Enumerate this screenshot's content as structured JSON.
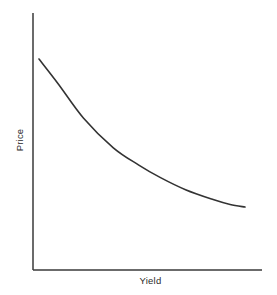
{
  "chart_data": {
    "type": "line",
    "title": "",
    "subtitle": "",
    "xlabel": "Yield",
    "ylabel": "Price",
    "grid": false,
    "legend": null,
    "legend_position": "none",
    "annotations": [],
    "xtick_labels": [],
    "ytick_labels": [],
    "xlim": [
      0,
      1
    ],
    "ylim": [
      0,
      1
    ],
    "series": [
      {
        "name": "price-yield-curve",
        "color": "#333333",
        "x": [
          0.03,
          0.12,
          0.24,
          0.38,
          0.5,
          0.6,
          0.72,
          0.85,
          0.93,
          1.0
        ],
        "y": [
          0.82,
          0.72,
          0.58,
          0.46,
          0.39,
          0.34,
          0.29,
          0.25,
          0.23,
          0.22
        ]
      }
    ]
  },
  "axes": {
    "line_color": "#3a3a3a",
    "y_axis_top": 13,
    "origin_x": 33,
    "origin_y": 270,
    "x_axis_right": 262
  },
  "curve_path": "M 39 59 C 57 83, 72 108, 88 133 C 104 150, 112 154, 120 159 C 140 170, 155 176, 170 180 C 192 189, 214 197, 228 203 L 245 207",
  "style": {
    "background": "#ffffff",
    "curve_color": "#333333",
    "curve_width": 1.6,
    "axis_width": 1.5,
    "label_color": "#2b2b2b"
  }
}
